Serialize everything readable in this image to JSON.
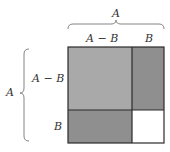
{
  "diagram": {
    "top_brace_label": "A",
    "top_segment_labels": [
      "A − B",
      "B"
    ],
    "left_brace_label": "A",
    "left_segment_labels": [
      "A − B",
      "B"
    ],
    "regions": [
      {
        "name": "(A-B)^2",
        "fill": "#a9a9a9"
      },
      {
        "name": "B(A-B) right",
        "fill": "#8f8f8f"
      },
      {
        "name": "B(A-B) bottom",
        "fill": "#8f8f8f"
      },
      {
        "name": "B^2",
        "fill": "#ffffff"
      }
    ],
    "stroke_color": "#2a2a2a",
    "brace_color": "#777777"
  }
}
